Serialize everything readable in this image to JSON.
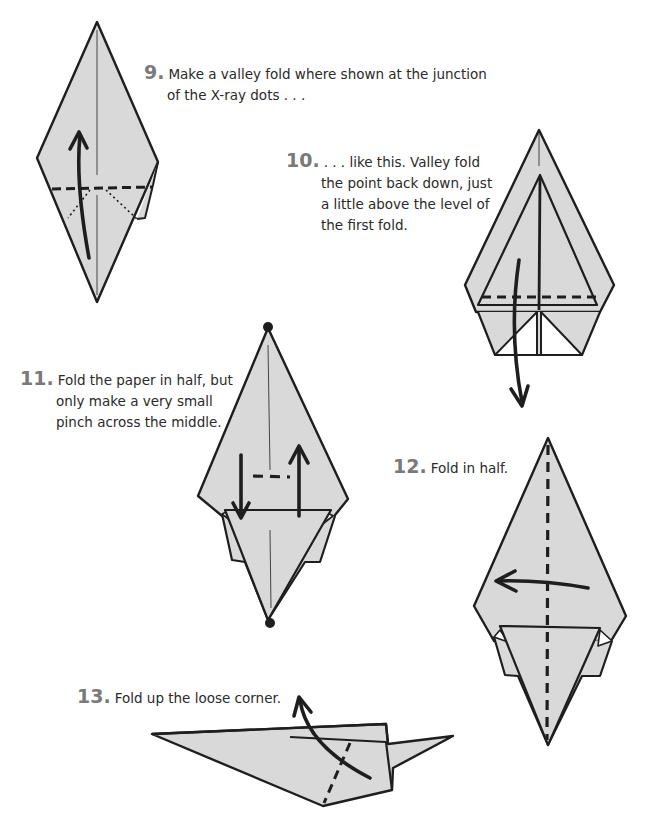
{
  "colors": {
    "paper_fill": "#d9d9d9",
    "line": "#1e1e1e",
    "step_number": "#7a7a7a",
    "background": "#ffffff"
  },
  "steps": [
    {
      "number": "9.",
      "lines": [
        "Make a valley fold where shown at the junction",
        "of the X-ray dots . . ."
      ]
    },
    {
      "number": "10.",
      "lines": [
        ". . . like this. Valley fold",
        "the point back down, just",
        "a little above the level of",
        "the first fold."
      ]
    },
    {
      "number": "11.",
      "lines": [
        "Fold the paper in half, but",
        "only make a very small",
        "pinch across the middle."
      ]
    },
    {
      "number": "12.",
      "lines": [
        "Fold in half."
      ]
    },
    {
      "number": "13.",
      "lines": [
        "Fold up the loose corner."
      ]
    }
  ]
}
